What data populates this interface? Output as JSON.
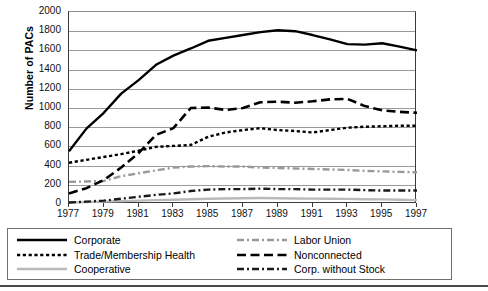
{
  "chart_data": {
    "type": "line",
    "title": "",
    "xlabel": "",
    "ylabel": "Number of PACs",
    "ylim": [
      0,
      2000
    ],
    "ytick_values": [
      2000,
      1800,
      1600,
      1400,
      1200,
      1000,
      800,
      600,
      400,
      200,
      0
    ],
    "ytick_labels": [
      "2000",
      "1800",
      "1600",
      "1400",
      "1200",
      "1000",
      "800",
      "600",
      "400",
      "200",
      "0"
    ],
    "xlim": [
      1977,
      1997
    ],
    "xtick_labels": [
      "1977",
      "1979",
      "1981",
      "1983",
      "1985",
      "1987",
      "1989",
      "1991",
      "1993",
      "1995",
      "1997"
    ],
    "x": [
      1977,
      1978,
      1979,
      1980,
      1981,
      1982,
      1983,
      1984,
      1985,
      1986,
      1987,
      1988,
      1989,
      1990,
      1991,
      1992,
      1993,
      1994,
      1995,
      1996,
      1997
    ],
    "grid": "horizontal",
    "legend_position": "bottom",
    "series": [
      {
        "name": "Corporate",
        "style": "solid",
        "color": "#000000",
        "width": 2.4,
        "values": [
          550,
          785,
          950,
          1150,
          1290,
          1450,
          1545,
          1620,
          1700,
          1730,
          1760,
          1790,
          1810,
          1800,
          1760,
          1715,
          1665,
          1660,
          1675,
          1640,
          1600
        ]
      },
      {
        "name": "Trade/Membership Health",
        "style": "dotted",
        "color": "#000000",
        "width": 2.4,
        "values": [
          430,
          460,
          490,
          520,
          555,
          595,
          605,
          615,
          700,
          745,
          770,
          790,
          770,
          760,
          745,
          770,
          795,
          805,
          810,
          815,
          815
        ]
      },
      {
        "name": "Cooperative",
        "style": "solid",
        "color": "#b9b9b9",
        "width": 2.4,
        "values": [
          15,
          20,
          25,
          30,
          35,
          40,
          45,
          50,
          55,
          58,
          60,
          62,
          60,
          58,
          56,
          55,
          53,
          50,
          48,
          45,
          40
        ]
      },
      {
        "name": "Labor Union",
        "style": "dashdot",
        "color": "#9a9a9a",
        "width": 2.4,
        "values": [
          230,
          235,
          240,
          290,
          320,
          350,
          380,
          390,
          395,
          390,
          390,
          380,
          375,
          370,
          365,
          360,
          355,
          345,
          340,
          335,
          330
        ]
      },
      {
        "name": "Nonconnected",
        "style": "longdash",
        "color": "#000000",
        "width": 2.6,
        "values": [
          110,
          165,
          250,
          380,
          530,
          720,
          790,
          1000,
          1005,
          980,
          1000,
          1060,
          1065,
          1055,
          1070,
          1090,
          1095,
          1020,
          975,
          960,
          950
        ]
      },
      {
        "name": "Corp. without Stock",
        "style": "dashdot",
        "color": "#1a1a1a",
        "width": 2.4,
        "values": [
          15,
          25,
          35,
          55,
          75,
          95,
          110,
          135,
          150,
          155,
          155,
          160,
          155,
          155,
          150,
          150,
          150,
          145,
          140,
          140,
          140
        ]
      }
    ]
  },
  "axis": {
    "ylabel": "Number of PACs"
  },
  "legend": {
    "left_column": [
      {
        "label": "Corporate",
        "swatch": "solid-black-line"
      },
      {
        "label": "Trade/Membership Health",
        "swatch": "dotted-black-line"
      },
      {
        "label": "Cooperative",
        "swatch": "solid-lightgray-line"
      }
    ],
    "right_column": [
      {
        "label": "Labor Union",
        "swatch": "dashdot-gray-line"
      },
      {
        "label": "Nonconnected",
        "swatch": "longdash-black-line"
      },
      {
        "label": "Corp. without Stock",
        "swatch": "dashdot-black-line"
      }
    ]
  }
}
